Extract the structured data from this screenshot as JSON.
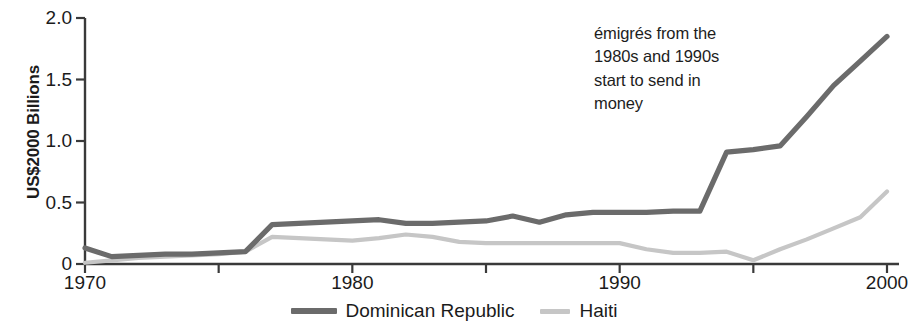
{
  "chart_data": {
    "type": "line",
    "title": "",
    "xlabel": "",
    "ylabel": "US$2000 Billions",
    "xlim": [
      1970,
      2000
    ],
    "ylim": [
      0,
      2.0
    ],
    "grid": false,
    "legend_position": "bottom-center",
    "x_ticks_major": [
      "1970",
      "1980",
      "1990",
      "2000"
    ],
    "x_ticks_major_values": [
      1970,
      1980,
      1990,
      2000
    ],
    "x_ticks_minor_values": [
      1975,
      1985,
      1995
    ],
    "y_ticks": [
      "0",
      "0.5",
      "1.0",
      "1.5",
      "2.0"
    ],
    "y_tick_values": [
      0,
      0.5,
      1.0,
      1.5,
      2.0
    ],
    "x": [
      1970,
      1971,
      1972,
      1973,
      1974,
      1975,
      1976,
      1977,
      1978,
      1979,
      1980,
      1981,
      1982,
      1983,
      1984,
      1985,
      1986,
      1987,
      1988,
      1989,
      1990,
      1991,
      1992,
      1993,
      1994,
      1995,
      1996,
      1997,
      1998,
      1999,
      2000
    ],
    "series": [
      {
        "name": "Dominican Republic",
        "color": "#6b6b6b",
        "values": [
          0.13,
          0.06,
          0.07,
          0.08,
          0.08,
          0.09,
          0.1,
          0.32,
          0.33,
          0.34,
          0.35,
          0.36,
          0.33,
          0.33,
          0.34,
          0.35,
          0.39,
          0.34,
          0.4,
          0.42,
          0.42,
          0.42,
          0.43,
          0.43,
          0.91,
          0.93,
          0.96,
          1.2,
          1.45,
          1.65,
          1.85
        ]
      },
      {
        "name": "Haiti",
        "color": "#c6c6c6",
        "values": [
          0.01,
          0.03,
          0.05,
          0.06,
          0.07,
          0.08,
          0.1,
          0.22,
          0.21,
          0.2,
          0.19,
          0.21,
          0.24,
          0.22,
          0.18,
          0.17,
          0.17,
          0.17,
          0.17,
          0.17,
          0.17,
          0.12,
          0.09,
          0.09,
          0.1,
          0.03,
          0.12,
          0.2,
          0.29,
          0.38,
          0.59
        ]
      }
    ],
    "annotations": [
      {
        "lines": [
          "émigrés from the",
          "1980s and 1990s",
          "start to send in",
          "money"
        ]
      }
    ]
  },
  "legend": {
    "items": [
      {
        "label": "Dominican Republic"
      },
      {
        "label": "Haiti"
      }
    ]
  },
  "colors": {
    "dominican_republic": "#6b6b6b",
    "haiti": "#c6c6c6",
    "axis": "#3a3a3a",
    "text": "#1b1b1b",
    "background": "#ffffff"
  }
}
